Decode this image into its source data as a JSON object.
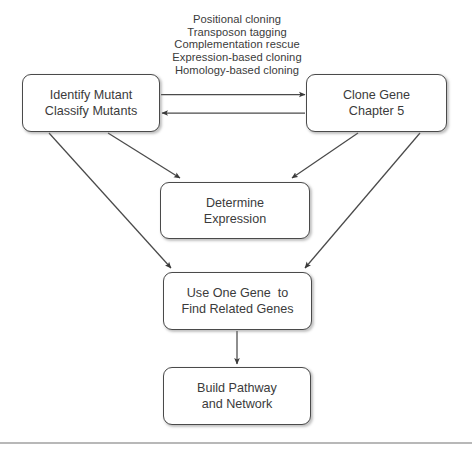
{
  "figure": {
    "background_color": "#ffffff",
    "node_border_color": "#4a4a4a",
    "text_color": "#3b3b3b",
    "edge_color": "#444444",
    "rule_color": "#b8b8b8"
  },
  "methods": {
    "label": "cloning-methods-list",
    "lines": [
      "Positional cloning",
      "Transposon tagging",
      "Complementation rescue",
      "Expression-based cloning",
      "Homology-based cloning"
    ]
  },
  "nodes": {
    "identify": {
      "line1": "Identify Mutant",
      "line2": "Classify Mutants"
    },
    "clone": {
      "line1": "Clone Gene",
      "line2": "Chapter 5"
    },
    "determine": {
      "line1": "Determine",
      "line2": "Expression"
    },
    "useone": {
      "line1": "Use One Gene  to",
      "line2": "Find Related Genes"
    },
    "build": {
      "line1": "Build Pathway",
      "line2": "and Network"
    }
  },
  "edges": [
    {
      "name": "identify-to-clone",
      "from": "identify",
      "to": "clone",
      "direction": "right"
    },
    {
      "name": "clone-to-identify",
      "from": "clone",
      "to": "identify",
      "direction": "left"
    },
    {
      "name": "identify-to-determine",
      "from": "identify",
      "to": "determine",
      "direction": "down-right"
    },
    {
      "name": "clone-to-determine",
      "from": "clone",
      "to": "determine",
      "direction": "down-left"
    },
    {
      "name": "identify-to-useone",
      "from": "identify",
      "to": "useone",
      "direction": "down-right"
    },
    {
      "name": "clone-to-useone",
      "from": "clone",
      "to": "useone",
      "direction": "down-left"
    },
    {
      "name": "useone-to-build",
      "from": "useone",
      "to": "build",
      "direction": "down"
    }
  ]
}
